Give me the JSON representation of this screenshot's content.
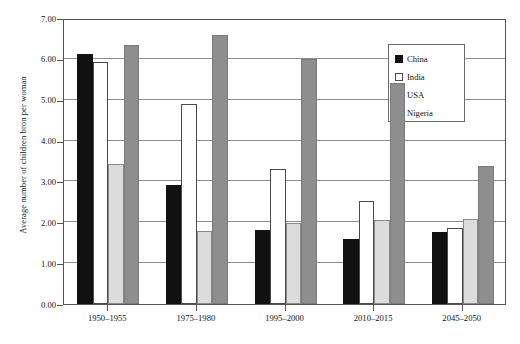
{
  "chart_data": {
    "type": "bar",
    "title": "",
    "xlabel": "",
    "ylabel": "Average number of children bron per woman",
    "ylim": [
      0,
      7
    ],
    "ytick_labels": [
      "0.00",
      "1.00",
      "2.00",
      "3.00",
      "4.00",
      "5.00",
      "6.00",
      "7.00"
    ],
    "ytick_values": [
      0,
      1,
      2,
      3,
      4,
      5,
      6,
      7
    ],
    "grid": true,
    "legend_position": "top-right",
    "categories": [
      "1950–1955",
      "1975–1980",
      "1995–2000",
      "2010–2015",
      "2045–2050"
    ],
    "series": [
      {
        "name": "China",
        "color": "#111111",
        "values": [
          6.11,
          2.92,
          1.81,
          1.58,
          1.77
        ]
      },
      {
        "name": "India",
        "color": "#ffffff",
        "values": [
          5.92,
          4.89,
          3.3,
          2.53,
          1.87
        ]
      },
      {
        "name": "USA",
        "color": "#dcdcdc",
        "values": [
          3.42,
          1.78,
          1.98,
          2.06,
          2.09
        ]
      },
      {
        "name": "Nigeria",
        "color": "#8e8e8e",
        "values": [
          6.33,
          6.59,
          5.99,
          5.42,
          3.37
        ]
      }
    ]
  },
  "legend": {
    "items": [
      {
        "label": "China",
        "swatch": "china"
      },
      {
        "label": "India",
        "swatch": "india"
      },
      {
        "label": "USA",
        "swatch": "usa"
      },
      {
        "label": "Nigeria",
        "swatch": "nigeria"
      }
    ]
  }
}
